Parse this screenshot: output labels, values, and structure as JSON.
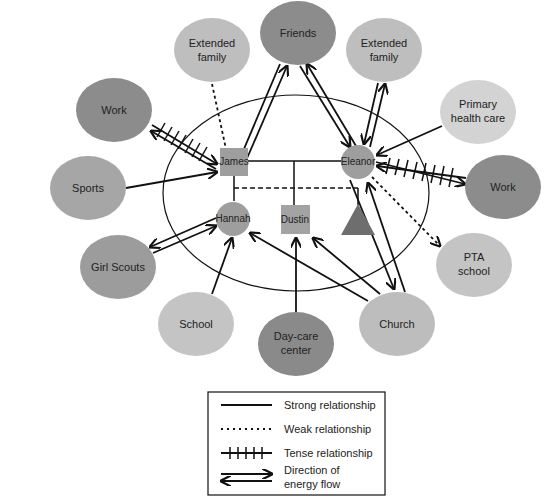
{
  "diagram": {
    "type": "ecomap",
    "colors": {
      "dark": "#8c8c8c",
      "medium": "#a6a6a6",
      "light": "#bebebe",
      "very_light": "#d3d3d3",
      "member": "#9e9e9e",
      "triangle": "#6e6e6e",
      "line": "#111111"
    },
    "family_members": {
      "james": "James",
      "eleanor": "Eleanor",
      "hannah": "Hannah",
      "dustin": "Dustin",
      "triangle": ""
    },
    "systems": {
      "friends": [
        "Friends"
      ],
      "extended_family_left": [
        "Extended",
        "family"
      ],
      "extended_family_right": [
        "Extended",
        "family"
      ],
      "work_left": [
        "Work"
      ],
      "primary_health_care": [
        "Primary",
        "health care"
      ],
      "sports": [
        "Sports"
      ],
      "work_right": [
        "Work"
      ],
      "girl_scouts": [
        "Girl Scouts"
      ],
      "pta_school": [
        "PTA",
        "school"
      ],
      "school": [
        "School"
      ],
      "day_care_center": [
        "Day-care",
        "center"
      ],
      "church": [
        "Church"
      ]
    },
    "relationships": [
      {
        "from": "Extended family (left)",
        "to": "James",
        "type": "weak",
        "direction": "to James"
      },
      {
        "from": "Friends",
        "to": "James",
        "type": "strong",
        "direction": "both"
      },
      {
        "from": "Friends",
        "to": "Eleanor",
        "type": "strong",
        "direction": "both"
      },
      {
        "from": "Extended family (right)",
        "to": "Eleanor",
        "type": "strong",
        "direction": "both"
      },
      {
        "from": "Work (left)",
        "to": "James",
        "type": "tense",
        "direction": "both"
      },
      {
        "from": "Primary health care",
        "to": "Eleanor",
        "type": "strong",
        "direction": "to Eleanor"
      },
      {
        "from": "Sports",
        "to": "James",
        "type": "strong",
        "direction": "to James"
      },
      {
        "from": "Work (right)",
        "to": "Eleanor",
        "type": "tense",
        "direction": "both"
      },
      {
        "from": "Girl Scouts",
        "to": "Hannah",
        "type": "strong",
        "direction": "both"
      },
      {
        "from": "Eleanor",
        "to": "PTA school",
        "type": "weak",
        "direction": "to PTA school"
      },
      {
        "from": "School",
        "to": "Hannah",
        "type": "strong",
        "direction": "to Hannah"
      },
      {
        "from": "Day-care center",
        "to": "Dustin",
        "type": "strong",
        "direction": "to Dustin"
      },
      {
        "from": "Church",
        "to": "Hannah",
        "type": "strong",
        "direction": "to Hannah"
      },
      {
        "from": "Church",
        "to": "Dustin",
        "type": "strong",
        "direction": "to Dustin"
      },
      {
        "from": "Church",
        "to": "Eleanor",
        "type": "strong",
        "direction": "both"
      }
    ]
  },
  "legend": {
    "strong": "Strong relationship",
    "weak": "Weak relationship",
    "tense": "Tense relationship",
    "direction": [
      "Direction of",
      "energy flow"
    ]
  }
}
